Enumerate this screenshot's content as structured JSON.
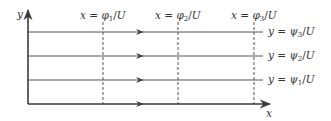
{
  "diagram": {
    "colors": {
      "axis": "#3a3a3a",
      "streamline": "#555555",
      "dashed": "#555555",
      "text": "#333333",
      "background": "#ffffff"
    },
    "axes": {
      "x_label": "x",
      "y_label": "y"
    },
    "potential_lines": [
      {
        "label": "x = φ₁/U",
        "var": "x",
        "greek": "φ",
        "sub": "1",
        "denom": "U"
      },
      {
        "label": "x = φ₂/U",
        "var": "x",
        "greek": "φ",
        "sub": "2",
        "denom": "U"
      },
      {
        "label": "x = φ₃/U",
        "var": "x",
        "greek": "φ",
        "sub": "3",
        "denom": "U"
      }
    ],
    "streamlines": [
      {
        "label": "y = ψ₃/U",
        "var": "y",
        "greek": "ψ",
        "sub": "3",
        "denom": "U"
      },
      {
        "label": "y = ψ₂/U",
        "var": "y",
        "greek": "ψ",
        "sub": "2",
        "denom": "U"
      },
      {
        "label": "y = ψ₁/U",
        "var": "y",
        "greek": "ψ",
        "sub": "1",
        "denom": "U"
      }
    ],
    "operators": {
      "equals": " = ",
      "slash": "/"
    }
  }
}
